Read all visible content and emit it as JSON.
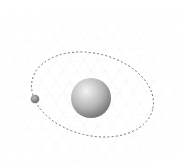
{
  "diagram": {
    "type": "orbit-illustration",
    "background": "#ffffff",
    "grid": {
      "style": "isometric-perspective",
      "color": "#e6e6e6",
      "opacity": 0.55
    },
    "orbit": {
      "cx": 92.5,
      "cy": 94.5,
      "rx": 62,
      "ry": 41,
      "rotation": 14,
      "stroke": "#707070",
      "dash": "2 2.2",
      "stroke_width": 0.9
    },
    "planet": {
      "name": "planet",
      "cx": 91,
      "cy": 98,
      "r": 20,
      "highlight": "#f4f4f4",
      "mid": "#b8b8b8",
      "shadow": "#6a6a6a"
    },
    "moon": {
      "name": "moon",
      "cx": 35,
      "cy": 99,
      "r": 4.3,
      "highlight": "#bdbdbd",
      "shadow": "#5e5e5e"
    }
  }
}
